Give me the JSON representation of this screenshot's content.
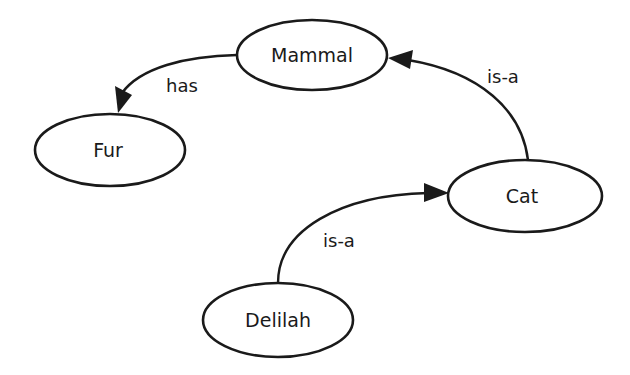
{
  "diagram": {
    "type": "semantic-network",
    "nodes": [
      {
        "id": "mammal",
        "label": "Mammal",
        "cx": 312,
        "cy": 55,
        "rx": 75,
        "ry": 35
      },
      {
        "id": "fur",
        "label": "Fur",
        "cx": 110,
        "cy": 150,
        "rx": 75,
        "ry": 36
      },
      {
        "id": "cat",
        "label": "Cat",
        "cx": 525,
        "cy": 196,
        "rx": 77,
        "ry": 36
      },
      {
        "id": "delilah",
        "label": "Delilah",
        "cx": 278,
        "cy": 320,
        "rx": 75,
        "ry": 37
      }
    ],
    "edges": [
      {
        "id": "mammal-has-fur",
        "from": "mammal",
        "to": "fur",
        "label": "has"
      },
      {
        "id": "cat-isa-mammal",
        "from": "cat",
        "to": "mammal",
        "label": "is-a"
      },
      {
        "id": "delilah-isa-cat",
        "from": "delilah",
        "to": "cat",
        "label": "is-a"
      }
    ]
  }
}
